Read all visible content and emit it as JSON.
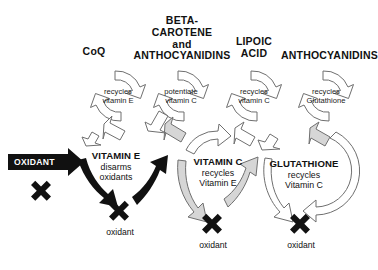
{
  "diagram": {
    "background": "#ffffff",
    "colors": {
      "black": "#111111",
      "gray_fill": "#d6d6d6",
      "white_fill": "#ffffff",
      "outline": "#6f6f6f"
    }
  },
  "headings": [
    {
      "id": "coq",
      "label": "CoQ"
    },
    {
      "id": "beta_carotene",
      "line1": "BETA-",
      "line2": "CAROTENE",
      "line3": "and",
      "line4": "ANTHOCYANIDINS"
    },
    {
      "id": "lipoic_acid",
      "line1": "LIPOIC",
      "line2": "ACID"
    },
    {
      "id": "anthocyanidins",
      "label": "ANTHOCYANIDINS"
    }
  ],
  "cycles": [
    {
      "id": "coq-cycle",
      "line1": "recycles",
      "line2": "vitamin E"
    },
    {
      "id": "beta-carotene-cycle",
      "line1": "potentiate",
      "line2": "vitamin C"
    },
    {
      "id": "lipoic-acid-cycle",
      "line1": "recycles",
      "line2": "vitamin C"
    },
    {
      "id": "anthocyanidins-cycle",
      "line1": "recycles",
      "line2": "Glutathione"
    }
  ],
  "banner": {
    "label": "OXIDANT"
  },
  "blocks": [
    {
      "id": "vitamin-e",
      "name": "VITAMIN E",
      "line2": "disarms",
      "line3": "oxidants"
    },
    {
      "id": "vitamin-c",
      "name": "VITAMIN C",
      "line2": "recycles",
      "line3": "Vitamin E"
    },
    {
      "id": "glutathione",
      "name": "GLUTATHIONE",
      "line2": "recycles",
      "line3": "Vitamin C"
    }
  ],
  "oxidant_outputs": [
    {
      "id": "oxidant-1",
      "label": "oxidant"
    },
    {
      "id": "oxidant-2",
      "label": "oxidant"
    },
    {
      "id": "oxidant-3",
      "label": "oxidant"
    }
  ],
  "icons": {
    "x_mark": "x-mark-icon",
    "banner_arrow": "oxidant-arrow-banner-icon",
    "ring_arrow": "circular-arrow-icon",
    "link_arrow": "curved-link-arrow-icon"
  }
}
